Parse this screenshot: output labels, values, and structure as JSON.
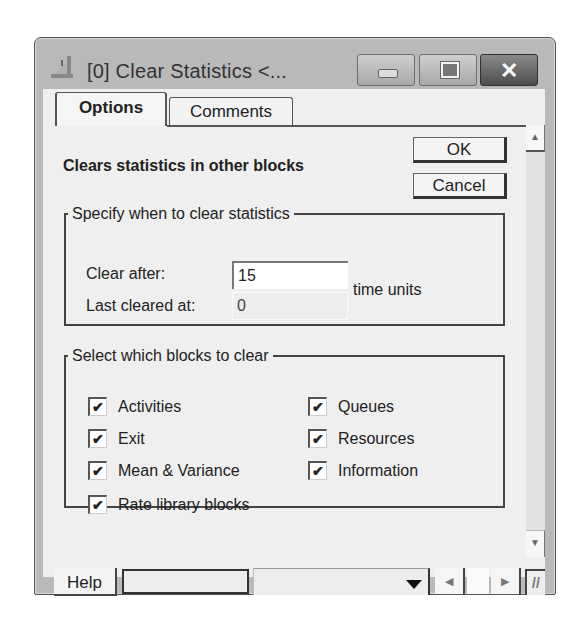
{
  "window": {
    "title": "[0]  Clear Statistics  <...",
    "controls": {
      "minimize": "minimize",
      "maximize": "maximize",
      "close": "✕"
    }
  },
  "tabs": [
    {
      "label": "Options",
      "active": true
    },
    {
      "label": "Comments",
      "active": false
    }
  ],
  "options": {
    "description": "Clears statistics in other blocks",
    "ok_label": "OK",
    "cancel_label": "Cancel",
    "when_group": {
      "legend": "Specify when to clear statistics",
      "clear_after_label": "Clear after:",
      "clear_after_value": "15",
      "last_cleared_label": "Last cleared at:",
      "last_cleared_value": "0",
      "units_label": "time units"
    },
    "blocks_group": {
      "legend": "Select which blocks to clear",
      "checkboxes": [
        {
          "label": "Activities",
          "checked": true
        },
        {
          "label": "Exit",
          "checked": true
        },
        {
          "label": "Mean & Variance",
          "checked": true
        },
        {
          "label": "Rate library blocks",
          "checked": true
        },
        {
          "label": "Queues",
          "checked": true
        },
        {
          "label": "Resources",
          "checked": true
        },
        {
          "label": "Information",
          "checked": true
        }
      ],
      "check_glyph": "✔"
    }
  },
  "statusbar": {
    "help_label": "Help",
    "status_field_value": "",
    "combo_value": ""
  },
  "scroll_glyphs": {
    "up": "▲",
    "down": "▼",
    "left": "◀",
    "right": "▶",
    "grip": "//"
  }
}
